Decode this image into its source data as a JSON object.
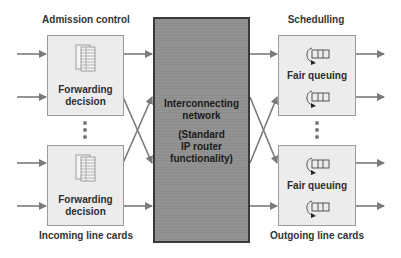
{
  "headers": {
    "left": "Admission control",
    "right": "Schedulling"
  },
  "footers": {
    "left": "Incoming line cards",
    "right": "Outgoing line cards"
  },
  "incoming_cards": [
    {
      "line1": "Forwarding",
      "line2": "decision",
      "icon": "forwarding-table-icon"
    },
    {
      "line1": "Forwarding",
      "line2": "decision",
      "icon": "forwarding-table-icon"
    }
  ],
  "outgoing_cards": [
    {
      "label": "Fair queuing",
      "icons": [
        "fair-queue-icon",
        "fair-queue-icon"
      ]
    },
    {
      "label": "Fair queuing",
      "icons": [
        "fair-queue-icon",
        "fair-queue-icon"
      ]
    }
  ],
  "network": {
    "line1": "Interconnecting",
    "line2": "network",
    "line3": "(Standard",
    "line4": "IP router",
    "line5": "functionality)"
  },
  "colors": {
    "network_fill": "#8e8e8e",
    "card_fill": "#ececec",
    "arrow": "#7a7a7a",
    "text": "#333333"
  }
}
